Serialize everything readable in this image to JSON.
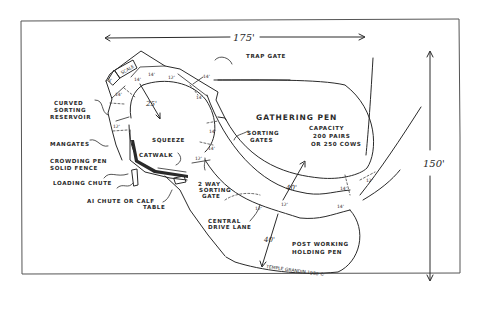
{
  "diagram": {
    "dimensions": {
      "width": "175'",
      "height": "150'",
      "reservoir_radius": "25'",
      "gathering_radius": "40'",
      "holding_radius": "40'",
      "lane_width": "12'",
      "seg_14a": "14'",
      "seg_14b": "14'",
      "seg_14c": "14'",
      "seg_14d": "14'",
      "seg_14e": "14'",
      "seg_14f": "14'",
      "seg_14g": "14'",
      "seg_14h": "14'",
      "seg_14i": "14'",
      "seg_12a": "12'",
      "seg_12b": "12'",
      "seg_12c": "12'",
      "seg_12d": "12'",
      "seg_3": "3'"
    },
    "labels": {
      "scale": "SCALE",
      "trap_gate": "TRAP GATE",
      "curved_sorting_reservoir": [
        "CURVED",
        "SORTING",
        "RESERVOIR"
      ],
      "mangates": "MANGATES",
      "crowding_pen": [
        "CROWDING PEN",
        "SOLID FENCE"
      ],
      "loading_chute": "LOADING CHUTE",
      "ai_chute": [
        "AI CHUTE OR CALF",
        "TABLE"
      ],
      "squeeze": "SQUEEZE",
      "catwalk": "CATWALK",
      "sorting_gates": [
        "SORTING",
        "GATES"
      ],
      "two_way_sorting_gate": [
        "2 WAY",
        "SORTING",
        "GATE"
      ],
      "gathering_pen": "GATHERING PEN",
      "capacity": [
        "CAPACITY",
        "200 PAIRS",
        "OR 250 COWS"
      ],
      "central_drive_lane": [
        "CENTRAL",
        "DRIVE LANE"
      ],
      "post_working_holding_pen": [
        "POST WORKING",
        "HOLDING PEN"
      ],
      "credit": "TEMPLE GRANDIN 1980 ©"
    },
    "colors": {
      "ink": "#2a2a2a",
      "background": "#ffffff",
      "frame": "#555555"
    }
  }
}
